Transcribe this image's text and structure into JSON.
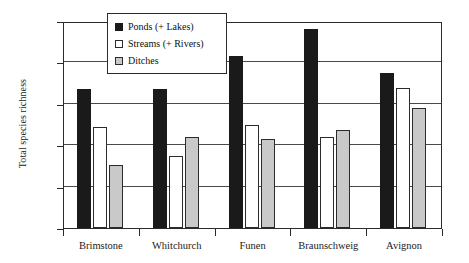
{
  "chart_data": {
    "type": "bar",
    "title": "",
    "xlabel": "",
    "ylabel": "Total species richness",
    "ylim": [
      0,
      100
    ],
    "yticks": [
      0,
      20,
      40,
      60,
      80,
      100
    ],
    "grid": true,
    "legend_position": "top-center-inside",
    "categories": [
      "Brimstone",
      "Whitchurch",
      "Funen",
      "Braunschweig",
      "Avignon"
    ],
    "series": [
      {
        "name": "Ponds (+ Lakes)",
        "color": "#1a1a1a",
        "values": [
          67,
          67,
          83,
          96,
          75
        ]
      },
      {
        "name": "Streams (+ Rivers)",
        "color": "#ffffff",
        "values": [
          49,
          35,
          50,
          44,
          67.5
        ]
      },
      {
        "name": "Ditches",
        "color": "#c9c9c9",
        "values": [
          30.5,
          44,
          43,
          47.5,
          58
        ]
      }
    ]
  },
  "legend": {
    "items": [
      {
        "label": "Ponds (+ Lakes)",
        "swatch": "filled-black-square"
      },
      {
        "label": "Streams (+ Rivers)",
        "swatch": "outlined-white-square"
      },
      {
        "label": "Ditches",
        "swatch": "filled-gray-square"
      }
    ]
  },
  "axis": {
    "y_labels": [
      "100",
      "80",
      "60",
      "40",
      "20",
      "0"
    ],
    "y_title": "Total species richness"
  }
}
